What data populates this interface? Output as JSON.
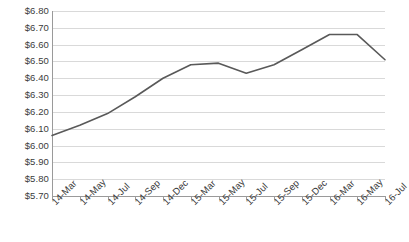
{
  "chart_data": {
    "type": "line",
    "title": "",
    "subtitle": "",
    "xlabel": "",
    "ylabel": "",
    "categories": [
      "14-Mar",
      "14-May",
      "14-Jul",
      "14-Sep",
      "14-Dec",
      "15-Mar",
      "15-May",
      "15-Jul",
      "15-Sep",
      "15-Dec",
      "16-Mar",
      "16-May",
      "16-Jul"
    ],
    "series": [
      {
        "name": "Price",
        "values": [
          6.06,
          6.12,
          6.19,
          6.29,
          6.4,
          6.48,
          6.49,
          6.43,
          6.48,
          6.57,
          6.66,
          6.66,
          6.51
        ],
        "color": "#595959"
      }
    ],
    "ylim": [
      5.7,
      6.8
    ],
    "ytick_values": [
      6.8,
      6.7,
      6.6,
      6.5,
      6.4,
      6.3,
      6.2,
      6.1,
      6.0,
      5.9,
      5.8,
      5.7
    ],
    "ytick_labels": [
      "$6.80",
      "$6.70",
      "$6.60",
      "$6.50",
      "$6.40",
      "$6.30",
      "$6.20",
      "$6.10",
      "$6.00",
      "$5.90",
      "$5.80",
      "$5.70"
    ],
    "grid": true,
    "grid_axis": "y",
    "legend": false,
    "legend_position": "none",
    "markers": false,
    "annotations": [],
    "colors": {
      "line": "#595959",
      "gridline": "#d9d9d9",
      "axis": "#9a9a9a",
      "text": "#3b3b3b",
      "background": "#ffffff"
    }
  }
}
